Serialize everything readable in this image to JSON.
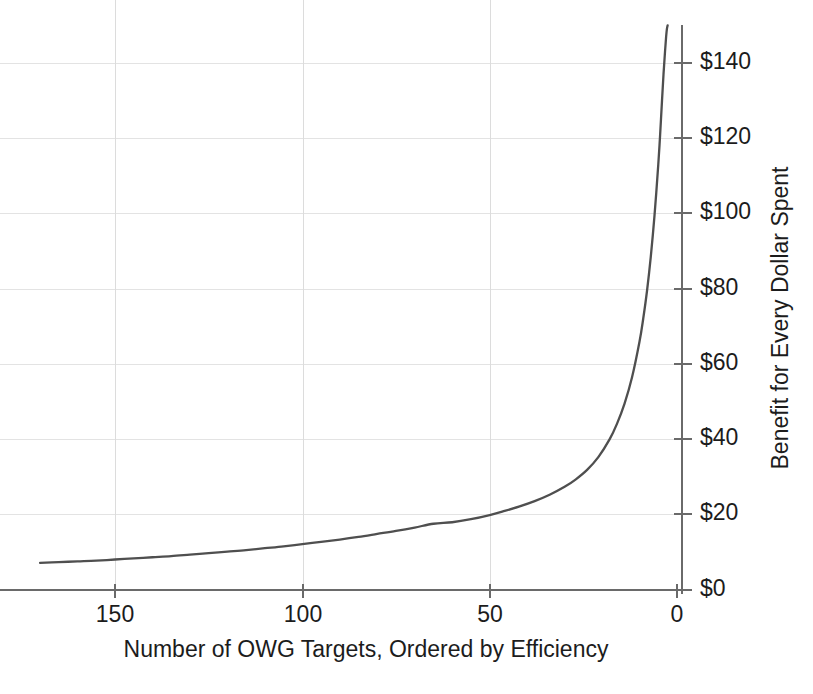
{
  "chart_data": {
    "type": "line",
    "title": "",
    "subtitle": "",
    "xlabel": "Number of OWG Targets, Ordered by Efficiency",
    "ylabel": "Benefit for Every Dollar Spent",
    "xlim": [
      170,
      0
    ],
    "ylim": [
      0,
      150
    ],
    "x_axis_reversed": true,
    "grid": true,
    "legend": null,
    "legend_position": "none",
    "x_ticks": [
      150,
      100,
      50,
      0
    ],
    "x_tick_labels": [
      "150",
      "100",
      "50",
      "0"
    ],
    "y_ticks": [
      0,
      20,
      40,
      60,
      80,
      100,
      120,
      140
    ],
    "y_tick_labels": [
      "$0",
      "$20",
      "$40",
      "$60",
      "$80",
      "$100",
      "$120",
      "$140"
    ],
    "series": [
      {
        "name": "Benefit-cost ratio by target rank",
        "color": "#4f4f4f",
        "x": [
          170,
          165,
          160,
          155,
          150,
          145,
          140,
          135,
          130,
          125,
          120,
          115,
          110,
          105,
          100,
          95,
          90,
          85,
          80,
          75,
          70,
          65,
          60,
          55,
          50,
          46,
          42,
          38,
          34,
          30,
          27,
          24,
          21,
          18,
          16,
          14,
          12,
          10,
          9,
          8,
          7,
          6,
          5,
          4.5,
          4,
          3.6,
          3.2,
          2.9,
          2.7,
          2.5
        ],
        "y": [
          7.2,
          7.4,
          7.6,
          7.8,
          8.1,
          8.4,
          8.7,
          9.0,
          9.4,
          9.8,
          10.2,
          10.6,
          11.1,
          11.6,
          12.2,
          12.8,
          13.4,
          14.1,
          14.9,
          15.7,
          16.6,
          17.6,
          18.0,
          18.8,
          19.9,
          21.0,
          22.2,
          23.6,
          25.3,
          27.4,
          29.4,
          31.9,
          35.3,
          40.0,
          44.2,
          49.5,
          56.5,
          66.0,
          72.2,
          79.5,
          88.5,
          99.5,
          113.0,
          121.0,
          130.0,
          137.0,
          143.0,
          147.0,
          149.0,
          150.0
        ]
      }
    ],
    "notable_points": [
      {
        "x": 170,
        "y": 7.2,
        "note": "left end of curve, lowest benefit"
      },
      {
        "x": 100,
        "y": 12.2,
        "note": "curve at 100 targets"
      },
      {
        "x": 50,
        "y": 19.9,
        "note": "curve crosses $20 gridline near 50 targets"
      },
      {
        "x": 21,
        "y": 35.3,
        "note": "curve passing mid-steepening"
      },
      {
        "x": 10,
        "y": 66.0,
        "note": "steep rise region"
      },
      {
        "x": 2.5,
        "y": 150.0,
        "note": "asymptotic top of curve at right axis"
      }
    ]
  },
  "axes": {
    "y_axis_title": "Benefit for Every Dollar Spent",
    "x_axis_title": "Number of OWG Targets, Ordered by Efficiency"
  }
}
